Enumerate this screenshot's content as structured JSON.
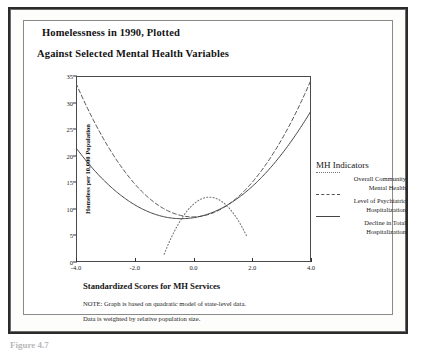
{
  "figure": {
    "title_line_1": "Homelessness in 1990, Plotted",
    "title_line_2": "Against Selected Mental Health Variables",
    "caption_partial": "Figure 4.7"
  },
  "notes": {
    "note_1": "NOTE:  Graph is based on quadratic model of state-level data.",
    "note_2": "Data is weighted by relative population size."
  },
  "legend": {
    "title": "MH Indicators",
    "entries": [
      {
        "label_line_1": "Overall Community",
        "label_line_2": "Mental Health",
        "style": "dotted"
      },
      {
        "label_line_1": "Level of Psychiatric",
        "label_line_2": "Hospitalization",
        "style": "dashed"
      },
      {
        "label_line_1": "Decline in Total",
        "label_line_2": "Hospitalization",
        "style": "solid"
      }
    ]
  },
  "chart_data": {
    "type": "line",
    "xlabel": "Standardized Scores for MH Services",
    "ylabel": "Homeless per 10,000 Population",
    "xlim": [
      -4.0,
      4.0
    ],
    "ylim": [
      0,
      35
    ],
    "xticks": [
      "-4.0",
      "-2.0",
      "0.0",
      "2.0",
      "4.0"
    ],
    "xtick_values": [
      -4.0,
      -2.0,
      0.0,
      2.0,
      4.0
    ],
    "yticks": [
      "0",
      "5",
      "10",
      "15",
      "20",
      "25",
      "30",
      "35"
    ],
    "ytick_values": [
      0,
      5,
      10,
      15,
      20,
      25,
      30,
      35
    ],
    "grid": false,
    "legend_position": "right",
    "x": [
      -4.0,
      -3.5,
      -3.0,
      -2.5,
      -2.0,
      -1.5,
      -1.0,
      -0.5,
      0.0,
      0.5,
      1.0,
      1.5,
      2.0,
      2.5,
      3.0,
      3.5,
      4.0
    ],
    "series": [
      {
        "name": "Overall Community Mental Health",
        "style": "dotted",
        "color": "#777777",
        "domain": [
          -1.0,
          1.8
        ],
        "vertex_x": 0.4,
        "vertex_y": 12.1,
        "values": [
          null,
          null,
          null,
          null,
          null,
          null,
          1.2,
          7.6,
          11.1,
          12.1,
          11.0,
          7.9,
          2.7,
          null,
          null,
          null,
          null
        ]
      },
      {
        "name": "Level of Psychiatric Hospitalization",
        "style": "dashed",
        "color": "#555555",
        "vertex_x": -0.35,
        "vertex_y": 7.6,
        "values": [
          32.5,
          27.6,
          23.2,
          19.2,
          15.6,
          12.5,
          9.9,
          8.2,
          7.7,
          8.1,
          9.6,
          12.0,
          15.2,
          19.3,
          24.0,
          28.5,
          33.5
        ]
      },
      {
        "name": "Decline in Total Hospitalization",
        "style": "solid",
        "color": "#444444",
        "vertex_x": -0.55,
        "vertex_y": 8.0,
        "values": [
          20.5,
          17.9,
          15.4,
          13.3,
          11.4,
          9.9,
          8.8,
          8.2,
          8.1,
          8.6,
          9.8,
          11.6,
          13.9,
          16.8,
          20.2,
          24.3,
          29.0
        ]
      }
    ]
  },
  "axes": {
    "y_title": "Homeless per 10,000 Population",
    "x_title": "Standardized Scores for MH Services"
  }
}
